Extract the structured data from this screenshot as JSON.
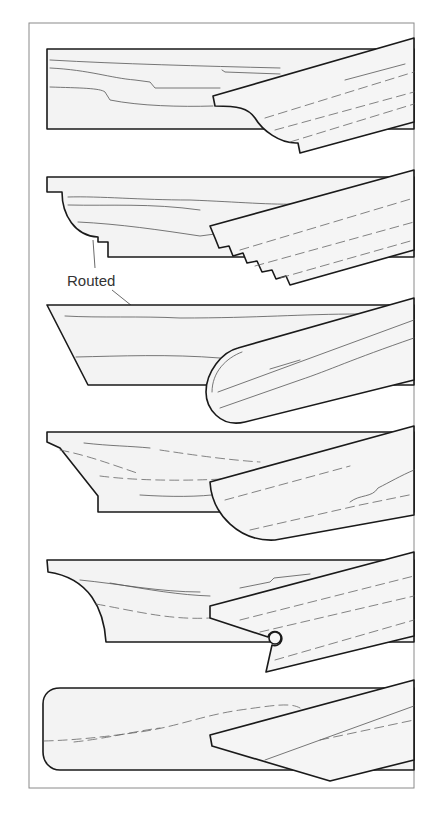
{
  "figure": {
    "label": "Routed",
    "profiles": [
      {
        "index": 1,
        "name": "ogee-edge"
      },
      {
        "index": 2,
        "name": "routed-cove-and-step-edge"
      },
      {
        "index": 3,
        "name": "bullnose-routed-edge"
      },
      {
        "index": 4,
        "name": "chamfer-with-quarter-round-edge"
      },
      {
        "index": 5,
        "name": "cove-with-bead-edge"
      },
      {
        "index": 6,
        "name": "rounded-corner-edge"
      }
    ]
  }
}
